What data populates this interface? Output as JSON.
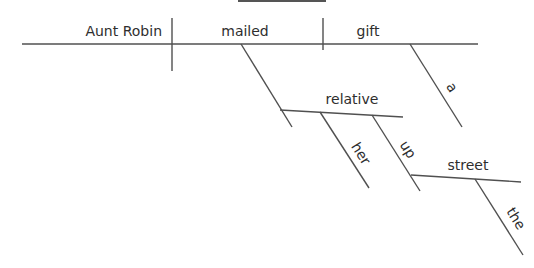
{
  "diagram": {
    "type": "sentence-diagram",
    "colors": {
      "line": "#505050",
      "text": "#2e2e2e",
      "background": "#ffffff"
    },
    "words": {
      "subject": "Aunt Robin",
      "verb": "mailed",
      "direct_object": "gift",
      "article_gift": "a",
      "prepositional_object": "relative",
      "possessive": "her",
      "adverb": "up",
      "street": "street",
      "article_street": "the"
    }
  }
}
